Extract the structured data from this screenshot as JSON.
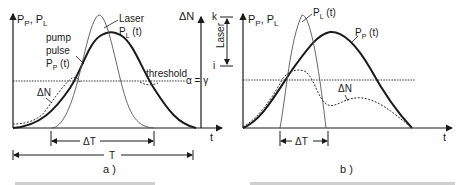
{
  "panel_a": {
    "caption": "a )",
    "y_axis_label_left": "P",
    "y_axis_sub_p": "P",
    "y_axis_sep": ",",
    "y_axis_label_L": "P",
    "y_axis_sub_L": "L",
    "x_axis_label": "t",
    "laser_label_line1": "Laser",
    "laser_label_line2_main": "P",
    "laser_label_line2_sub": "L",
    "laser_label_line2_arg": " (t)",
    "pump_label_line1": "pump",
    "pump_label_line2": "pulse",
    "pump_label_line3_main": "P",
    "pump_label_line3_sub": "P",
    "pump_label_line3_arg": " (t)",
    "threshold_label": "threshold",
    "threshold_condition": "α = γ",
    "delta_n_label": "ΔN",
    "delta_n_axis_label": "ΔN",
    "delta_t_label": "ΔT",
    "total_t_label": "T",
    "level_k": "k",
    "level_i": "i",
    "laser_band_label": "Laser"
  },
  "panel_b": {
    "caption": "b )",
    "y_axis_label": "P",
    "x_axis_label": "t",
    "pl_label_main": "P",
    "pl_label_sub": "L",
    "pl_label_arg": " (t)",
    "pp_label_main": "P",
    "pp_label_sub": "P",
    "pp_label_arg": " (t)",
    "delta_n_label": "ΔN",
    "delta_t_label": "ΔT"
  },
  "colors": {
    "ink": "#1a1a1a",
    "laser_curve": "#555555",
    "background": "#ffffff"
  }
}
